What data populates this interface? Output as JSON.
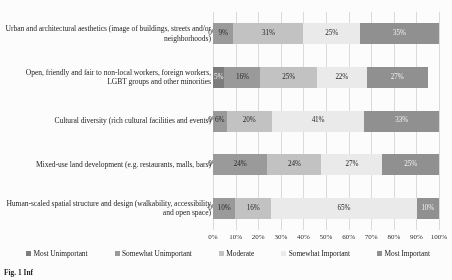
{
  "chart_data": {
    "type": "bar",
    "orientation": "horizontal",
    "stacked": true,
    "stack_mode": "percent",
    "title": "",
    "subtitle": "",
    "xlabel": "",
    "ylabel": "",
    "xlim": [
      0,
      100
    ],
    "grid": true,
    "legend_position": "bottom",
    "xticks": [
      "0%",
      "10%",
      "20%",
      "30%",
      "40%",
      "50%",
      "60%",
      "70%",
      "80%",
      "90%",
      "100%"
    ],
    "xtick_values": [
      0,
      10,
      20,
      30,
      40,
      50,
      60,
      70,
      80,
      90,
      100
    ],
    "categories": [
      "Urban and architectural aesthetics (image of buildings, streets and/or neighborhoods)",
      "Open, friendly and fair to non-local workers, foreign workers, LGBT groups and other minorities",
      "Cultural diversity (rich cultural facilities and events)",
      "Mixed-use land development (e.g. restaurants, malls, bars)",
      "Human-scaled spatial structure and design (walkability, accessibility and open space)"
    ],
    "series": [
      {
        "name": "Most Unimportant",
        "color": "#7b7b7b",
        "values": [
          0,
          5,
          0,
          0,
          0
        ],
        "labels": [
          "0%",
          "5%",
          "0%",
          "0%",
          "0%"
        ]
      },
      {
        "name": "Somewhat Unimportant",
        "color": "#9a9a9a",
        "values": [
          9,
          16,
          6,
          24,
          10
        ],
        "labels": [
          "9%",
          "16%",
          "6%",
          "24%",
          "10%"
        ]
      },
      {
        "name": "Moderate",
        "color": "#c3c3c3",
        "values": [
          31,
          25,
          20,
          24,
          16
        ],
        "labels": [
          "31%",
          "25%",
          "20%",
          "24%",
          "16%"
        ]
      },
      {
        "name": "Somewhat Important",
        "color": "#ececec",
        "values": [
          25,
          22,
          41,
          27,
          65
        ],
        "labels": [
          "25%",
          "22%",
          "41%",
          "27%",
          "65%"
        ]
      },
      {
        "name": "Most Important",
        "color": "#8f8f8f",
        "values": [
          35,
          27,
          33,
          25,
          10
        ],
        "labels": [
          "35%",
          "27%",
          "33%",
          "25%",
          "10%"
        ]
      }
    ]
  },
  "caption": {
    "text": "Fig. 1 Inf"
  }
}
